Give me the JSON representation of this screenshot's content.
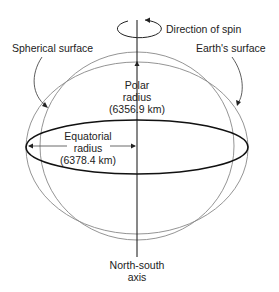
{
  "diagram": {
    "labels": {
      "spin": "Direction of spin",
      "spherical": "Spherical surface",
      "earth": "Earth's surface",
      "polar_line1": "Polar",
      "polar_line2": "radius",
      "polar_value": "(6356.9 km)",
      "equatorial_line1": "Equatorial",
      "equatorial_line2": "radius",
      "equatorial_value": "(6378.4 km)",
      "axis_line1": "North-south",
      "axis_line2": "axis"
    },
    "colors": {
      "thin_line": "#777777",
      "bold_line": "#111111",
      "text": "#222222"
    }
  }
}
